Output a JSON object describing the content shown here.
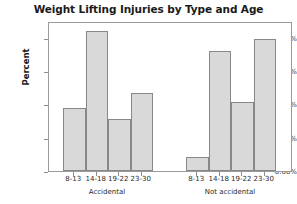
{
  "chart_data": {
    "type": "bar",
    "title": "Weight Lifting Injuries by Type and Age",
    "xlabel": "",
    "ylabel": "Percent",
    "ylim": [
      0,
      45
    ],
    "grid": false,
    "legend": "none",
    "y_ticks": [
      {
        "value": 0,
        "label": "0.00%"
      },
      {
        "value": 10,
        "label": "10.00%"
      },
      {
        "value": 20,
        "label": "20.00%"
      },
      {
        "value": 30,
        "label": "30.00%"
      },
      {
        "value": 40,
        "label": "40.00%"
      }
    ],
    "groups": [
      {
        "name": "Accidental",
        "categories": [
          "8-13",
          "14-18",
          "19-22",
          "23-30"
        ],
        "values": [
          19.0,
          42.0,
          15.5,
          23.5
        ]
      },
      {
        "name": "Not accidental",
        "categories": [
          "8-13",
          "14-18",
          "19-22",
          "23-30"
        ],
        "values": [
          4.2,
          36.0,
          20.8,
          39.7
        ]
      }
    ],
    "colors": {
      "bar_fill": "#d9d9d9",
      "bar_edge": "#888888",
      "frame": "#9a9a9a",
      "text": "#1a1a1a"
    }
  }
}
